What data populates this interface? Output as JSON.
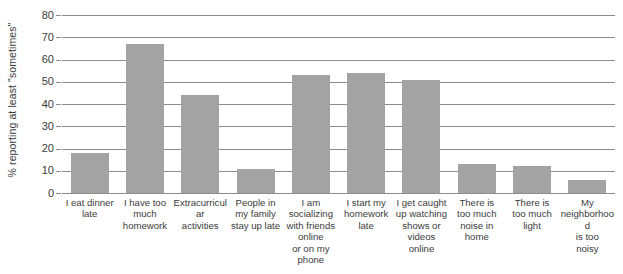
{
  "chart_data": {
    "type": "bar",
    "title": "",
    "xlabel": "",
    "ylabel": "% reporting at least \"sometimes\"",
    "ylim": [
      0,
      80
    ],
    "ytick_values": [
      0,
      10,
      20,
      30,
      40,
      50,
      60,
      70,
      80
    ],
    "ytick_labels": [
      "0",
      "10",
      "20",
      "30",
      "40",
      "50",
      "60",
      "70",
      "80"
    ],
    "grid": true,
    "legend": "none",
    "bar_color": "#a3a3a3",
    "categories": [
      "I eat dinner late",
      "I have too much homework",
      "Extracurricular activities",
      "People in my family stay up late",
      "I am socializing with friends online or on my phone",
      "I start my homework late",
      "I get caught up watching shows or videos online",
      "There is too much noise in home",
      "There is too much light",
      "My neighborhood is too noisy"
    ],
    "category_lines": [
      [
        "I eat dinner",
        "late"
      ],
      [
        "I have too",
        "much",
        "homework"
      ],
      [
        "Extracurricular",
        "activities"
      ],
      [
        "People in",
        "my family",
        "stay up late"
      ],
      [
        "I am",
        "socializing",
        "with friends",
        "online",
        "or on my",
        "phone"
      ],
      [
        "I start my",
        "homework",
        "late"
      ],
      [
        "I get caught",
        "up watching",
        "shows or",
        "videos online"
      ],
      [
        "There is",
        "too much",
        "noise in",
        "home"
      ],
      [
        "There is",
        "too much",
        "light"
      ],
      [
        "My",
        "neighborhood",
        "is too",
        "noisy"
      ]
    ],
    "values": [
      18,
      67,
      44,
      11,
      53,
      54,
      51,
      13,
      12,
      6
    ]
  }
}
